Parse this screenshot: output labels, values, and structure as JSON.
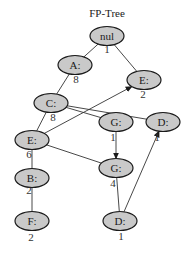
{
  "diagram": {
    "title": "FP-Tree",
    "colors": {
      "node_fill": "#c9c9c9",
      "node_stroke": "#1a1a1a",
      "edge": "#333333",
      "text": "#1a1a1a"
    },
    "nodes": [
      {
        "id": "nul",
        "label": "nul",
        "count": "1",
        "cx": 107,
        "cy": 36,
        "count_x": 107,
        "count_y": 53
      },
      {
        "id": "A",
        "label": "A:",
        "count": "8",
        "cx": 75,
        "cy": 65,
        "count_x": 76,
        "count_y": 83
      },
      {
        "id": "E1",
        "label": "E:",
        "count": "2",
        "cx": 144,
        "cy": 80,
        "count_x": 143,
        "count_y": 98
      },
      {
        "id": "C",
        "label": "C:",
        "count": "8",
        "cx": 51,
        "cy": 103,
        "count_x": 53,
        "count_y": 121
      },
      {
        "id": "G1",
        "label": "G:",
        "count": "1",
        "cx": 116,
        "cy": 122,
        "count_x": 113,
        "count_y": 141
      },
      {
        "id": "D1",
        "label": "D:",
        "count": "1",
        "cx": 163,
        "cy": 122,
        "count_x": 157,
        "count_y": 141
      },
      {
        "id": "E2",
        "label": "E:",
        "count": "6",
        "cx": 32,
        "cy": 140,
        "count_x": 29,
        "count_y": 158
      },
      {
        "id": "G2",
        "label": "G:",
        "count": "4",
        "cx": 116,
        "cy": 168,
        "count_x": 113,
        "count_y": 187
      },
      {
        "id": "B",
        "label": "B:",
        "count": "2",
        "cx": 32,
        "cy": 178,
        "count_x": 29,
        "count_y": 194
      },
      {
        "id": "D2",
        "label": "D:",
        "count": "1",
        "cx": 120,
        "cy": 221,
        "count_x": 121,
        "count_y": 240
      },
      {
        "id": "F",
        "label": "F:",
        "count": "2",
        "cx": 32,
        "cy": 221,
        "count_x": 31,
        "count_y": 241
      }
    ],
    "edges": [
      {
        "from": "nul",
        "to": "A",
        "directed": false
      },
      {
        "from": "nul",
        "to": "E1",
        "directed": false
      },
      {
        "from": "A",
        "to": "C",
        "directed": false
      },
      {
        "from": "C",
        "to": "E2",
        "directed": false
      },
      {
        "from": "C",
        "to": "G1",
        "directed": false
      },
      {
        "from": "C",
        "to": "D1",
        "directed": false
      },
      {
        "from": "E2",
        "to": "E1",
        "directed": true
      },
      {
        "from": "G1",
        "to": "G2",
        "directed": true
      },
      {
        "from": "E2",
        "to": "G2",
        "directed": false
      },
      {
        "from": "E2",
        "to": "B",
        "directed": false
      },
      {
        "from": "B",
        "to": "F",
        "directed": false
      },
      {
        "from": "G2",
        "to": "D2",
        "directed": false
      },
      {
        "from": "D2",
        "to": "D1",
        "directed": true
      }
    ]
  }
}
